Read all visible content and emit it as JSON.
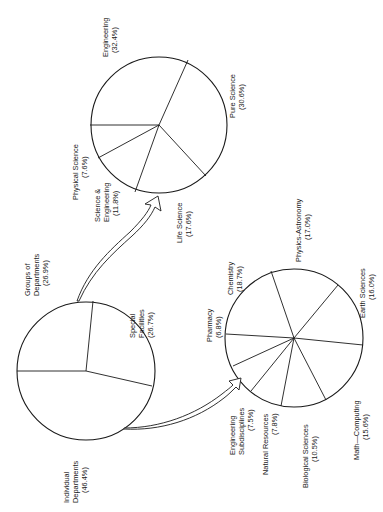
{
  "chart_data": [
    {
      "type": "pie",
      "name": "overall",
      "title": "",
      "center": [
        86,
        371
      ],
      "radius": 69,
      "spokes": [
        [
          17,
          371
        ],
        [
          93,
          301
        ],
        [
          152,
          386
        ]
      ],
      "slices": [
        {
          "label": "Groups of Departments",
          "value": 26.9,
          "display": "(26.9%)"
        },
        {
          "label": "Special Facilities",
          "value": 26.7,
          "display": "(26.7%)"
        },
        {
          "label": "Individual Departments",
          "value": 46.4,
          "display": "(46.4%)"
        }
      ]
    },
    {
      "type": "pie",
      "name": "groups-of-departments-breakdown",
      "title": "",
      "center": [
        159,
        125
      ],
      "radius": 68,
      "spokes": [
        [
          188,
          60
        ],
        [
          90,
          125
        ],
        [
          98,
          158
        ],
        [
          135,
          192
        ],
        [
          206,
          176
        ]
      ],
      "slices": [
        {
          "label": "Engineering",
          "value": 32.4,
          "display": "(32.4%)"
        },
        {
          "label": "Pure Science",
          "value": 30.6,
          "display": "(30.6%)"
        },
        {
          "label": "Life Science",
          "value": 17.6,
          "display": "(17.6%)"
        },
        {
          "label": "Science & Engineering",
          "value": 11.8,
          "display": "(11.8%)"
        },
        {
          "label": "Physical Science",
          "value": 7.6,
          "display": "(7.6%)"
        }
      ]
    },
    {
      "type": "pie",
      "name": "individual-departments-breakdown",
      "title": "",
      "center": [
        294,
        338
      ],
      "radius": 69,
      "spokes": [
        [
          271,
          271
        ],
        [
          338,
          285
        ],
        [
          363,
          345
        ],
        [
          326,
          400
        ],
        [
          281,
          406
        ],
        [
          251,
          391
        ],
        [
          233,
          366
        ],
        [
          226,
          334
        ]
      ],
      "slices": [
        {
          "label": "Chemistry",
          "value": 18.7,
          "display": "(18.7%)"
        },
        {
          "label": "Physics-Astronomy",
          "value": 17.0,
          "display": "(17.0%)"
        },
        {
          "label": "Earth Sciences",
          "value": 16.0,
          "display": "(16.0%)"
        },
        {
          "label": "Math—Computing",
          "value": 15.6,
          "display": "(15.6%)"
        },
        {
          "label": "Biological Sciences",
          "value": 10.5,
          "display": "(10.5%)"
        },
        {
          "label": "Natural Resources",
          "value": 7.8,
          "display": "(7.8%)"
        },
        {
          "label": "Engineering Subdisciplines",
          "value": 7.5,
          "display": "(7.5%)"
        },
        {
          "label": "Pharmacy",
          "value": 6.8,
          "display": "(6.8%)"
        }
      ]
    }
  ],
  "labels": {
    "groups_line1": "Groups of",
    "groups_line2": "Departments",
    "groups_pct": "(26.9%)",
    "special_line1": "Special",
    "special_line2": "Facilities",
    "special_pct": "(26.7%)",
    "individual_line1": "Individual",
    "individual_line2": "Departments",
    "individual_pct": "(46.4%)",
    "engineering": "Engineering",
    "engineering_pct": "(32.4%)",
    "pure_science": "Pure Science",
    "pure_science_pct": "(30.6%)",
    "life_science": "Life Science",
    "life_science_pct": "(17.6%)",
    "sci_eng_line1": "Science &",
    "sci_eng_line2": "Engineering",
    "sci_eng_pct": "(11.8%)",
    "physical_science": "Physical Science",
    "physical_science_pct": "(7.6%)",
    "chemistry": "Chemistry",
    "chemistry_pct": "(18.7%)",
    "physics_astronomy": "Physics-Astronomy",
    "physics_astronomy_pct": "(17.0%)",
    "earth_sciences": "Earth Sciences",
    "earth_sciences_pct": "(16.0%)",
    "math_computing": "Math—Computing",
    "math_computing_pct": "(15.6%)",
    "biological_sciences": "Biological Sciences",
    "biological_sciences_pct": "(10.5%)",
    "natural_resources": "Natural Resources",
    "natural_resources_pct": "(7.8%)",
    "eng_sub_line1": "Engineering",
    "eng_sub_line2": "Subdisciplines",
    "eng_sub_pct": "(7.5%)",
    "pharmacy": "Pharmacy",
    "pharmacy_pct": "(6.8%)"
  },
  "colors": {
    "ink": "#1a1a1a",
    "paper": "#ffffff"
  }
}
